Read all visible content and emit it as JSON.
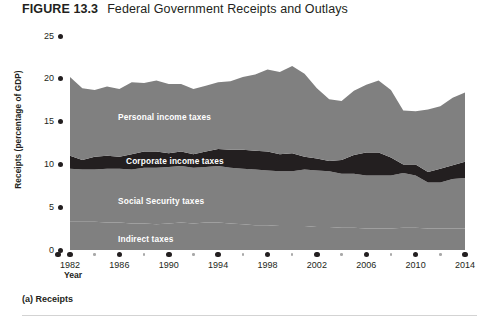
{
  "figure": {
    "number": "FIGURE 13.3",
    "title": "Federal Government Receipts and Outlays",
    "panel_caption": "(a) Receipts"
  },
  "colors": {
    "band_gray": "#808080",
    "corporate_dark": "#231f20",
    "text": "#231f20",
    "label_white": "#ffffff",
    "rule": "#d3d3d3",
    "minor_tick": "#a8a8a8"
  },
  "chart_data": {
    "type": "area",
    "title": "Federal Government Receipts and Outlays",
    "subtitle": "(a) Receipts",
    "xlabel": "Year",
    "ylabel": "Receipts (percentage of GDP)",
    "xlim": [
      1982,
      2014
    ],
    "ylim": [
      0,
      25
    ],
    "grid": false,
    "legend": "in-plot band labels",
    "stacked": true,
    "y_ticks": [
      0,
      5,
      10,
      15,
      20,
      25
    ],
    "x_ticks_major": [
      1982,
      1986,
      1990,
      1994,
      1998,
      2002,
      2006,
      2010,
      2014
    ],
    "x_ticks_minor": [
      1984,
      1988,
      1992,
      1996,
      2000,
      2004,
      2008,
      2012
    ],
    "x": [
      1982,
      1983,
      1984,
      1985,
      1986,
      1987,
      1988,
      1989,
      1990,
      1991,
      1992,
      1993,
      1994,
      1995,
      1996,
      1997,
      1998,
      1999,
      2000,
      2001,
      2002,
      2003,
      2004,
      2005,
      2006,
      2007,
      2008,
      2009,
      2010,
      2011,
      2012,
      2013,
      2014
    ],
    "series": [
      {
        "name": "Indirect taxes",
        "values": [
          3.3,
          3.3,
          3.3,
          3.2,
          3.2,
          3.1,
          3.1,
          3.0,
          3.1,
          3.2,
          3.1,
          3.2,
          3.2,
          3.1,
          3.0,
          2.9,
          2.9,
          2.8,
          2.8,
          2.8,
          2.7,
          2.7,
          2.6,
          2.6,
          2.5,
          2.5,
          2.5,
          2.6,
          2.6,
          2.5,
          2.5,
          2.5,
          2.5
        ]
      },
      {
        "name": "Social Security taxes",
        "values": [
          6.2,
          6.1,
          6.1,
          6.3,
          6.3,
          6.3,
          6.5,
          6.6,
          6.6,
          6.6,
          6.5,
          6.5,
          6.6,
          6.5,
          6.5,
          6.5,
          6.4,
          6.4,
          6.4,
          6.6,
          6.6,
          6.5,
          6.3,
          6.3,
          6.2,
          6.2,
          6.2,
          6.4,
          6.1,
          5.4,
          5.4,
          5.8,
          5.9
        ]
      },
      {
        "name": "Corporate income taxes",
        "values": [
          1.5,
          1.1,
          1.5,
          1.5,
          1.4,
          1.8,
          1.9,
          1.9,
          1.6,
          1.7,
          1.6,
          1.8,
          2.0,
          2.1,
          2.2,
          2.2,
          2.2,
          2.0,
          2.1,
          1.5,
          1.4,
          1.2,
          1.6,
          2.2,
          2.7,
          2.7,
          2.1,
          1.0,
          1.3,
          1.2,
          1.6,
          1.6,
          1.9
        ]
      },
      {
        "name": "Personal income taxes",
        "values": [
          9.2,
          8.4,
          7.8,
          8.1,
          7.9,
          8.4,
          8.0,
          8.3,
          8.1,
          7.9,
          7.6,
          7.7,
          7.8,
          8.0,
          8.5,
          8.9,
          9.6,
          9.6,
          10.2,
          9.7,
          8.2,
          7.2,
          6.9,
          7.5,
          7.9,
          8.4,
          7.9,
          6.3,
          6.2,
          7.3,
          7.3,
          7.9,
          8.1
        ]
      }
    ],
    "total_receipts": [
      20.2,
      18.9,
      18.7,
      19.1,
      18.8,
      19.6,
      19.5,
      19.8,
      19.4,
      19.4,
      18.8,
      19.2,
      19.6,
      19.7,
      20.2,
      20.5,
      21.1,
      20.8,
      21.5,
      20.6,
      18.9,
      17.6,
      17.4,
      18.6,
      19.3,
      19.8,
      18.7,
      16.3,
      16.2,
      16.4,
      16.8,
      17.8,
      18.4
    ],
    "band_labels": [
      {
        "text": "Personal income taxes",
        "x_px": 118,
        "y_px": 112
      },
      {
        "text": "Corporate income taxes",
        "x_px": 126,
        "y_px": 156
      },
      {
        "text": "Social Security taxes",
        "x_px": 118,
        "y_px": 196
      },
      {
        "text": "Indirect taxes",
        "x_px": 118,
        "y_px": 234
      }
    ]
  }
}
